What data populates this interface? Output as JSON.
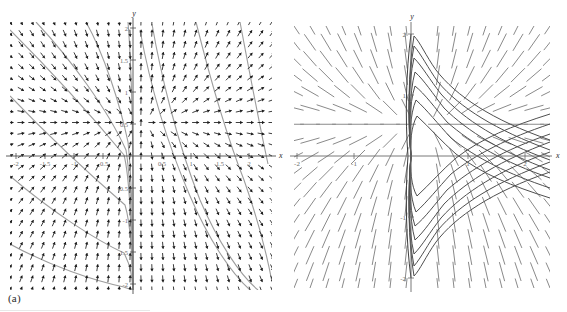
{
  "figure": {
    "panels": [
      {
        "id": "a",
        "caption": "(a)",
        "kind": "direction-field-with-solution-curves"
      },
      {
        "id": "b",
        "caption": "(b)",
        "kind": "streamline-field-with-solution-curves"
      }
    ]
  },
  "chart_data": [
    {
      "type": "scatter",
      "id": "panel-a",
      "title": "",
      "subtitle": "",
      "xlabel": "x",
      "ylabel": "y",
      "xlim": [
        -2,
        2
      ],
      "ylim": [
        -2,
        2
      ],
      "grid": false,
      "legend": "none",
      "legend_position": "none",
      "annotations": [
        "(a)"
      ],
      "axis_label_x": "x",
      "axis_label_y": "y",
      "xticks": [
        -2,
        -1.5,
        -1,
        -0.5,
        0.5,
        1,
        1.5,
        2
      ],
      "xtick_labels": [
        "-2",
        "-1.5",
        "-1",
        "-0.5",
        "0.5",
        "1",
        "1.5",
        "2"
      ],
      "yticks": [
        -2,
        -1.5,
        -1,
        -0.5,
        0.5,
        1,
        1.5,
        2
      ],
      "ytick_labels": [
        "-2",
        "-1.5",
        "-1",
        "-0.5",
        "0.5",
        "1",
        "1.5",
        "2"
      ],
      "field": {
        "style": "arrows",
        "grid_nx": 25,
        "grid_ny": 25,
        "arrow_color": "#1b1b1b",
        "arrow_length": 7,
        "description": "slope field arrows, steep near x=0, shallow up-right away from axis"
      },
      "curves": {
        "count": 7,
        "color": "#8e8e8e",
        "description": "solution curves sweeping from upper-left down to lower-right, converging near x=0"
      }
    },
    {
      "type": "line",
      "id": "panel-b",
      "title": "",
      "subtitle": "",
      "xlabel": "x",
      "ylabel": "y",
      "xlim": [
        -2,
        2
      ],
      "ylim": [
        -2,
        2
      ],
      "grid": false,
      "legend": "none",
      "legend_position": "none",
      "annotations": [
        "(b)"
      ],
      "axis_label_x": "x",
      "axis_label_y": "y",
      "xticks": [
        -2,
        -1,
        1,
        2
      ],
      "xtick_labels": [
        "-2",
        "-1",
        "1",
        "2"
      ],
      "yticks": [
        -2,
        -1,
        1,
        2
      ],
      "ytick_labels": [
        "-2",
        "-1",
        "1",
        "2"
      ],
      "field": {
        "style": "streaklines",
        "color": "#8a8a8a",
        "description": "long diagonal stream segments sloping down-right across the plane"
      },
      "curves": {
        "count": 14,
        "color": "#4a4a4a",
        "description": "nested integral curves emanating from the y-axis, hooking right in upper half and lower half"
      }
    }
  ],
  "colors": {
    "background": "#ffffff",
    "axis": "#5a5a5a",
    "arrow": "#1b1b1b",
    "curve_light": "#9a9a9a",
    "curve_dark": "#4a4a4a",
    "stream": "#8a8a8a",
    "text": "#2b2b2b",
    "tick_text": "#6d6d6d"
  },
  "panel_a": {
    "axis_x_label": "x",
    "axis_y_label": "y",
    "xtick_labels": [
      "-2",
      "-1.5",
      "-1",
      "-0.5",
      "0.5",
      "1",
      "1.5",
      "2"
    ],
    "ytick_labels": [
      "-2",
      "-1.5",
      "-1",
      "-0.5",
      "0.5",
      "1",
      "1.5",
      "2"
    ],
    "caption": "(a)"
  },
  "panel_b": {
    "axis_x_label": "x",
    "axis_y_label": "y",
    "xtick_labels": [
      "-2",
      "-1",
      "1",
      "2"
    ],
    "ytick_labels": [
      "-2",
      "-1",
      "1",
      "2"
    ],
    "caption": "(b)"
  }
}
